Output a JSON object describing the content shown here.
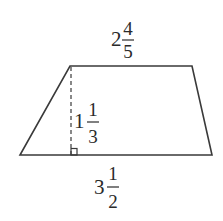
{
  "figure": {
    "type": "trapezoid",
    "colors": {
      "stroke": "#3a3a3a",
      "text": "#2a2a2a",
      "background": "#ffffff"
    },
    "vertices": {
      "top_left": [
        70,
        66
      ],
      "top_right": [
        192,
        66
      ],
      "bottom_right": [
        212,
        155
      ],
      "bottom_left": [
        20,
        155
      ]
    },
    "right_angle_marker": true,
    "height_line_style": "dashed"
  },
  "labels": {
    "top_base": {
      "whole": "2",
      "numerator": "4",
      "denominator": "5",
      "text": "2 4/5"
    },
    "height": {
      "whole": "1",
      "numerator": "1",
      "denominator": "3",
      "text": "1 1/3"
    },
    "bottom_base": {
      "whole": "3",
      "numerator": "1",
      "denominator": "2",
      "text": "3 1/2"
    }
  }
}
